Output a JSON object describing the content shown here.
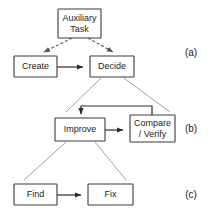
{
  "diagram": {
    "type": "flowchart",
    "background_color": "#ffffff",
    "box_stroke_color": "#3a3a3a",
    "arrow_color": "#2b2b2b",
    "expansion_line_color": "#888888",
    "groups": [
      {
        "id": "a",
        "label": "(a)",
        "label_x": 191,
        "label_y": 53
      },
      {
        "id": "b",
        "label": "(b)",
        "label_x": 191,
        "label_y": 129
      },
      {
        "id": "c",
        "label": "(c)",
        "label_x": 191,
        "label_y": 195
      }
    ],
    "nodes": [
      {
        "id": "auxiliary-task",
        "lines": [
          "Auxiliary",
          "Task"
        ],
        "line1": "Auxiliary",
        "line2": "Task",
        "x": 58,
        "y": 9,
        "width": 43,
        "height": 29,
        "group": "a"
      },
      {
        "id": "create",
        "lines": [
          "Create"
        ],
        "line1": "Create",
        "x": 14,
        "y": 56,
        "width": 43,
        "height": 21,
        "group": "a"
      },
      {
        "id": "decide",
        "lines": [
          "Decide"
        ],
        "line1": "Decide",
        "x": 90,
        "y": 56,
        "width": 44,
        "height": 21,
        "group": "a"
      },
      {
        "id": "improve",
        "lines": [
          "Improve"
        ],
        "line1": "Improve",
        "x": 55,
        "y": 118,
        "width": 50,
        "height": 23,
        "group": "b"
      },
      {
        "id": "compare-verify",
        "lines": [
          "Compare",
          "/ Verify"
        ],
        "line1": "Compare",
        "line2": "/ Verify",
        "x": 130,
        "y": 115,
        "width": 45,
        "height": 27,
        "group": "b"
      },
      {
        "id": "find",
        "lines": [
          "Find"
        ],
        "line1": "Find",
        "x": 14,
        "y": 184,
        "width": 43,
        "height": 21,
        "group": "c"
      },
      {
        "id": "fix",
        "lines": [
          "Fix"
        ],
        "line1": "Fix",
        "x": 88,
        "y": 184,
        "width": 45,
        "height": 21,
        "group": "c"
      }
    ],
    "edges": [
      {
        "id": "auxiliary-to-create",
        "from": "auxiliary-task",
        "to": "create",
        "style": "dashed",
        "arrow": true
      },
      {
        "id": "auxiliary-to-decide",
        "from": "auxiliary-task",
        "to": "decide",
        "style": "dashed",
        "arrow": true
      },
      {
        "id": "create-to-decide",
        "from": "create",
        "to": "decide",
        "style": "solid",
        "arrow": true
      },
      {
        "id": "improve-to-compare",
        "from": "improve",
        "to": "compare-verify",
        "style": "solid",
        "arrow": true
      },
      {
        "id": "compare-to-improve-feedback",
        "from": "compare-verify",
        "to": "improve",
        "style": "solid",
        "arrow": true
      },
      {
        "id": "find-to-fix",
        "from": "find",
        "to": "fix",
        "style": "solid",
        "arrow": true
      }
    ],
    "expansions": [
      {
        "id": "decide-expands-to-b",
        "from": "decide",
        "to_group": "b"
      },
      {
        "id": "improve-expands-to-c",
        "from": "improve",
        "to_group": "c"
      }
    ]
  }
}
